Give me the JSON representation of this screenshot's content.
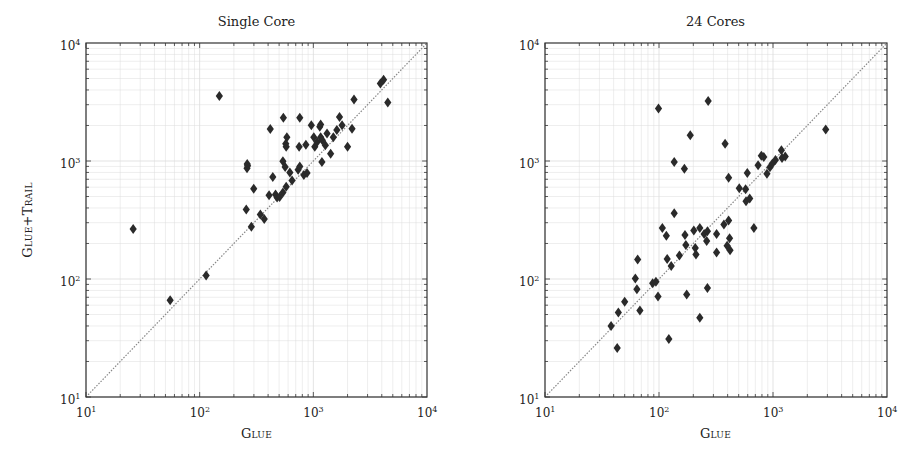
{
  "figure": {
    "panels": [
      {
        "title": "Single Core",
        "xlabel": "Glue",
        "ylabel": "Glue+Trail"
      },
      {
        "title": "24 Cores",
        "xlabel": "Glue",
        "ylabel": ""
      }
    ],
    "tick_labels": [
      "10",
      "10",
      "10",
      "10"
    ],
    "tick_exponents": [
      "1",
      "2",
      "3",
      "4"
    ],
    "colors": {
      "marker": "#2a2a2a",
      "frame": "#333333",
      "grid": "#dcdcdc",
      "diagonal": "#888888"
    }
  },
  "chart_data": [
    {
      "type": "scatter",
      "title": "Single Core",
      "xlabel": "Glue",
      "ylabel": "Glue+Trail",
      "xscale": "log",
      "yscale": "log",
      "xlim": [
        10,
        10000
      ],
      "ylim": [
        10,
        10000
      ],
      "grid": true,
      "reference_line": "y = x",
      "marker": "diamond",
      "x": [
        26,
        55,
        114,
        149,
        257,
        261,
        264,
        262,
        299,
        285,
        342,
        370,
        408,
        418,
        440,
        465,
        480,
        505,
        540,
        545,
        540,
        565,
        572,
        585,
        577,
        577,
        622,
        650,
        750,
        735,
        760,
        760,
        825,
        860,
        880,
        960,
        1010,
        1030,
        1080,
        1140,
        1160,
        1160,
        1190,
        1200,
        1275,
        1320,
        1420,
        1500,
        1610,
        1700,
        1790,
        2000,
        2190,
        2280,
        3890,
        4150,
        4520
      ],
      "y": [
        265,
        66,
        107,
        3550,
        388,
        870,
        910,
        945,
        582,
        277,
        352,
        323,
        513,
        1870,
        731,
        520,
        490,
        495,
        540,
        2330,
        995,
        890,
        1400,
        1590,
        1320,
        605,
        800,
        685,
        1320,
        845,
        2330,
        900,
        760,
        1375,
        790,
        2010,
        1590,
        1320,
        1450,
        1950,
        2040,
        1590,
        980,
        1500,
        1360,
        1710,
        1150,
        1590,
        1830,
        2360,
        2010,
        1320,
        1880,
        3320,
        4540,
        4880,
        3130
      ]
    },
    {
      "type": "scatter",
      "title": "24 Cores",
      "xlabel": "Glue",
      "ylabel": "",
      "xscale": "log",
      "yscale": "log",
      "xlim": [
        10,
        10000
      ],
      "ylim": [
        10,
        10000
      ],
      "grid": true,
      "reference_line": "y = x",
      "marker": "diamond",
      "x": [
        38,
        43,
        44,
        50,
        62,
        64,
        65,
        68,
        88,
        94,
        98,
        99,
        107,
        116,
        118,
        122,
        128,
        136,
        136,
        151,
        167,
        169,
        172,
        175,
        188,
        202,
        208,
        211,
        228,
        228,
        249,
        262,
        266,
        270,
        266,
        320,
        320,
        371,
        380,
        396,
        408,
        408,
        416,
        420,
        506,
        575,
        580,
        595,
        625,
        680,
        740,
        790,
        830,
        885,
        940,
        985,
        1050,
        1185,
        1200,
        1280,
        2900
      ],
      "y": [
        40,
        26,
        52,
        64,
        101,
        82,
        146,
        54,
        92,
        95,
        71,
        2780,
        270,
        233,
        148,
        31,
        129,
        361,
        980,
        158,
        860,
        236,
        194,
        74,
        1650,
        258,
        183,
        161,
        270,
        47,
        241,
        210,
        254,
        3230,
        84,
        241,
        168,
        289,
        1400,
        191,
        720,
        313,
        222,
        175,
        588,
        575,
        455,
        790,
        480,
        270,
        920,
        1110,
        1080,
        780,
        885,
        950,
        1020,
        1235,
        1060,
        1090,
        1850
      ]
    }
  ]
}
